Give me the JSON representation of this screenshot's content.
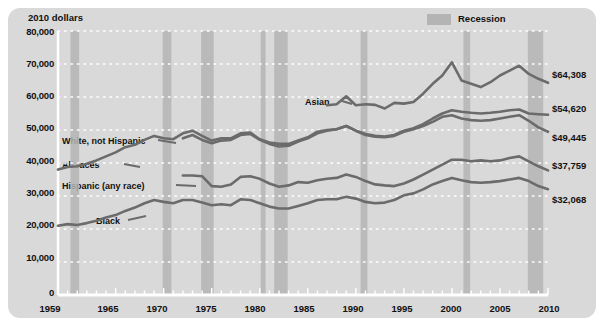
{
  "figure": {
    "y_axis_title": "2010 dollars",
    "legend": {
      "label": "Recession",
      "swatch_color": "#b4b4b4"
    },
    "panel_color": "#d9d9d9",
    "line_color": "#6b6b6b",
    "gridline_color": "#ffffff",
    "axis_color": "#ffffff"
  },
  "chart_data": {
    "type": "line",
    "title": "",
    "subtitle": "",
    "xlabel": "",
    "ylabel": "2010 dollars",
    "xlim": [
      1959,
      2010
    ],
    "ylim": [
      0,
      80000
    ],
    "grid": true,
    "grid_style": "dotted-white-horizontal",
    "legend_position": "top-right",
    "y_ticks": [
      0,
      10000,
      20000,
      30000,
      40000,
      50000,
      60000,
      70000,
      80000
    ],
    "y_tick_labels": [
      "0",
      "10,000",
      "20,000",
      "30,000",
      "40,000",
      "50,000",
      "60,000",
      "70,000",
      "80,000"
    ],
    "x_ticks": [
      1959,
      1965,
      1970,
      1975,
      1980,
      1985,
      1990,
      1995,
      2000,
      2005,
      2010
    ],
    "x_tick_labels": [
      "1959",
      "1965",
      "1970",
      "1975",
      "1980",
      "1985",
      "1990",
      "1995",
      "2000",
      "2005",
      "2010"
    ],
    "x_minor_tick_interval": 1,
    "recession_bands": [
      {
        "start": 1960.3,
        "end": 1961.2
      },
      {
        "start": 1969.9,
        "end": 1970.8
      },
      {
        "start": 1973.9,
        "end": 1975.2
      },
      {
        "start": 1980.1,
        "end": 1980.6
      },
      {
        "start": 1981.5,
        "end": 1982.9
      },
      {
        "start": 1990.5,
        "end": 1991.2
      },
      {
        "start": 2001.2,
        "end": 2001.9
      },
      {
        "start": 2007.9,
        "end": 2009.5
      }
    ],
    "series": [
      {
        "name": "Asian",
        "label": "Asian",
        "end_value_label": "$64,308",
        "end_value": 64308,
        "x": [
          1987,
          1988,
          1989,
          1990,
          1991,
          1992,
          1993,
          1994,
          1995,
          1996,
          1997,
          1998,
          1999,
          2000,
          2001,
          2002,
          2003,
          2004,
          2005,
          2006,
          2007,
          2008,
          2009,
          2010
        ],
        "y": [
          57500,
          57800,
          60200,
          57500,
          57800,
          57600,
          56500,
          58200,
          58000,
          58500,
          61000,
          64000,
          66500,
          70500,
          65000,
          64000,
          63000,
          64500,
          66500,
          68000,
          69500,
          67000,
          65500,
          64308
        ]
      },
      {
        "name": "White, not Hispanic",
        "label": "White, not Hispanic",
        "end_value_label": "$54,620",
        "end_value": 54620,
        "x": [
          1972,
          1973,
          1974,
          1975,
          1976,
          1977,
          1978,
          1979,
          1980,
          1981,
          1982,
          1983,
          1984,
          1985,
          1986,
          1987,
          1988,
          1989,
          1990,
          1991,
          1992,
          1993,
          1994,
          1995,
          1996,
          1997,
          1998,
          1999,
          2000,
          2001,
          2002,
          2003,
          2004,
          2005,
          2006,
          2007,
          2008,
          2009,
          2010
        ],
        "y": [
          47500,
          48500,
          47000,
          46000,
          46800,
          47000,
          48500,
          48800,
          47000,
          45800,
          45000,
          45200,
          46500,
          47500,
          49000,
          49800,
          50200,
          51200,
          49800,
          48800,
          48200,
          48000,
          48500,
          49800,
          50500,
          51800,
          53500,
          55000,
          56000,
          55500,
          55200,
          55000,
          55200,
          55500,
          56000,
          56200,
          55000,
          54800,
          54620
        ]
      },
      {
        "name": "All races",
        "label": "All races",
        "end_value_label": "$49,445",
        "end_value": 49445,
        "x": [
          1959,
          1960,
          1961,
          1962,
          1963,
          1964,
          1965,
          1966,
          1967,
          1968,
          1969,
          1970,
          1971,
          1972,
          1973,
          1974,
          1975,
          1976,
          1977,
          1978,
          1979,
          1980,
          1981,
          1982,
          1983,
          1984,
          1985,
          1986,
          1987,
          1988,
          1989,
          1990,
          1991,
          1992,
          1993,
          1994,
          1995,
          1996,
          1997,
          1998,
          1999,
          2000,
          2001,
          2002,
          2003,
          2004,
          2005,
          2006,
          2007,
          2008,
          2009,
          2010
        ],
        "y": [
          38000,
          38800,
          39000,
          39800,
          40800,
          42000,
          43200,
          44800,
          45500,
          47000,
          48200,
          47500,
          47200,
          49000,
          49800,
          48200,
          46800,
          47500,
          47500,
          49000,
          49200,
          47200,
          46200,
          45800,
          45800,
          46800,
          47800,
          49500,
          50000,
          50200,
          51200,
          49800,
          48500,
          48000,
          47800,
          48200,
          49500,
          50200,
          51200,
          52500,
          54000,
          54500,
          53500,
          53000,
          52800,
          53000,
          53500,
          54000,
          54500,
          52800,
          50800,
          49445
        ]
      },
      {
        "name": "Hispanic (any race)",
        "label": "Hispanic (any race)",
        "end_value_label": "$37,759",
        "end_value": 37759,
        "x": [
          1972,
          1973,
          1974,
          1975,
          1976,
          1977,
          1978,
          1979,
          1980,
          1981,
          1982,
          1983,
          1984,
          1985,
          1986,
          1987,
          1988,
          1989,
          1990,
          1991,
          1992,
          1993,
          1994,
          1995,
          1996,
          1997,
          1998,
          1999,
          2000,
          2001,
          2002,
          2003,
          2004,
          2005,
          2006,
          2007,
          2008,
          2009,
          2010
        ],
        "y": [
          36200,
          36200,
          36000,
          33000,
          32800,
          33500,
          35800,
          36000,
          35200,
          33800,
          32800,
          33200,
          34200,
          34000,
          34800,
          35200,
          35500,
          36500,
          35800,
          34500,
          33500,
          33200,
          33000,
          33800,
          35000,
          36500,
          38000,
          39500,
          41000,
          41000,
          40500,
          40800,
          40500,
          40800,
          41500,
          42000,
          40500,
          39000,
          37759
        ]
      },
      {
        "name": "Black",
        "label": "Black",
        "end_value_label": "$32,068",
        "end_value": 32068,
        "x": [
          1959,
          1960,
          1961,
          1962,
          1963,
          1964,
          1965,
          1966,
          1967,
          1968,
          1969,
          1970,
          1971,
          1972,
          1973,
          1974,
          1975,
          1976,
          1977,
          1978,
          1979,
          1980,
          1981,
          1982,
          1983,
          1984,
          1985,
          1986,
          1987,
          1988,
          1989,
          1990,
          1991,
          1992,
          1993,
          1994,
          1995,
          1996,
          1997,
          1998,
          1999,
          2000,
          2001,
          2002,
          2003,
          2004,
          2005,
          2006,
          2007,
          2008,
          2009,
          2010
        ],
        "y": [
          21000,
          21500,
          21200,
          21800,
          22500,
          23500,
          24200,
          25500,
          26500,
          27800,
          28800,
          28200,
          27800,
          28800,
          28800,
          28000,
          27200,
          27500,
          27200,
          29000,
          28800,
          27800,
          26800,
          26200,
          26200,
          27000,
          27800,
          28800,
          29000,
          29000,
          29800,
          29200,
          28200,
          27800,
          28000,
          28800,
          30200,
          30800,
          32000,
          33500,
          34500,
          35500,
          34800,
          34200,
          34000,
          34200,
          34500,
          35000,
          35500,
          34500,
          33000,
          32068
        ]
      }
    ]
  },
  "series_inline_labels": [
    {
      "name": "asian",
      "text": "Asian"
    },
    {
      "name": "white-not-hispanic",
      "text": "White, not Hispanic"
    },
    {
      "name": "all-races",
      "text": "All races"
    },
    {
      "name": "hispanic-any-race",
      "text": "Hispanic (any race)"
    },
    {
      "name": "black",
      "text": "Black"
    }
  ]
}
